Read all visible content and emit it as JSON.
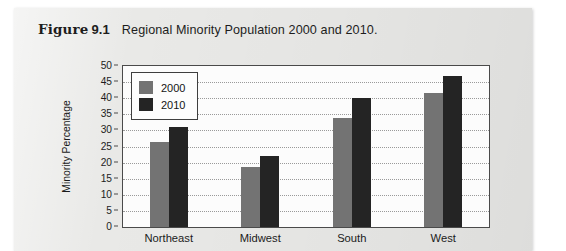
{
  "figure": {
    "label_word": "Figure",
    "number": "9.1",
    "title": "Regional Minority Population 2000 and 2010."
  },
  "chart_data": {
    "type": "bar",
    "title": "Regional Minority Population 2000 and 2010.",
    "xlabel": "",
    "ylabel": "Minority Percentage",
    "categories": [
      "Northeast",
      "Midwest",
      "South",
      "West"
    ],
    "series": [
      {
        "name": "2000",
        "color": "#737373",
        "values": [
          26.5,
          18.5,
          34.0,
          41.5
        ]
      },
      {
        "name": "2010",
        "color": "#242424",
        "values": [
          31.0,
          22.0,
          40.0,
          47.0
        ]
      }
    ],
    "ylim": [
      0,
      50
    ],
    "ytick_step": 5,
    "yticks": [
      "50",
      "45",
      "40",
      "35",
      "30",
      "25",
      "20",
      "15",
      "10",
      "5",
      "0"
    ],
    "grid": true,
    "legend_position": "top-left",
    "legend_entries": [
      "2000",
      "2010"
    ]
  },
  "colors": {
    "series_2000": "#737373",
    "series_2010": "#242424",
    "page_background": "#e9e9e7",
    "plot_background": "#fcfcfc",
    "axis": "#4a4a4a"
  }
}
